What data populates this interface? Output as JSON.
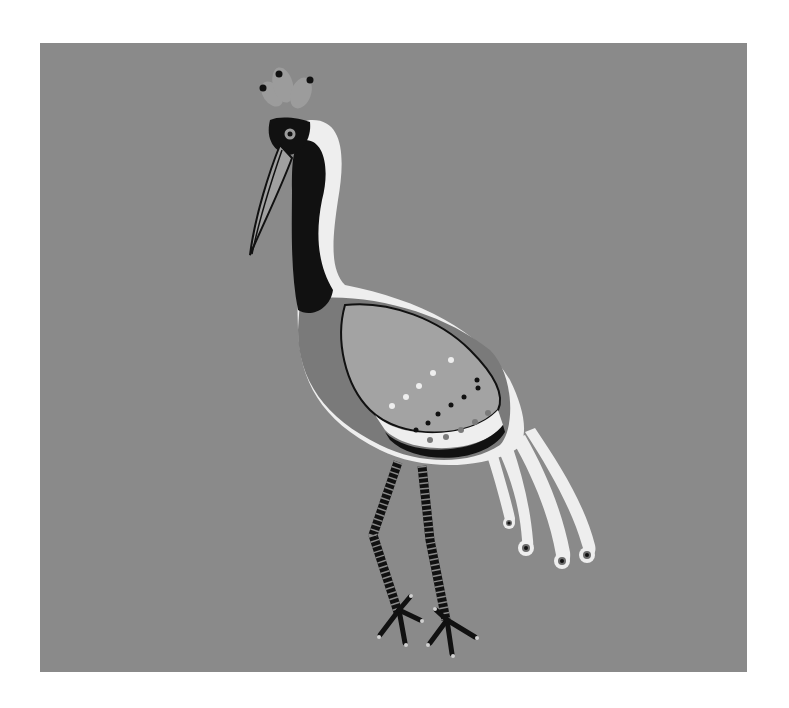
{
  "image": {
    "subject": "stylized crowned crane bird illustration",
    "background_color": "#8a8a8a",
    "page_color": "#ffffff"
  },
  "colors": {
    "body_grey": "#7a7a7a",
    "wing_light": "#a3a3a3",
    "white": "#eeeeee",
    "black": "#111111",
    "crest": "#9c9c9c",
    "beak": "#a0a0a0"
  }
}
